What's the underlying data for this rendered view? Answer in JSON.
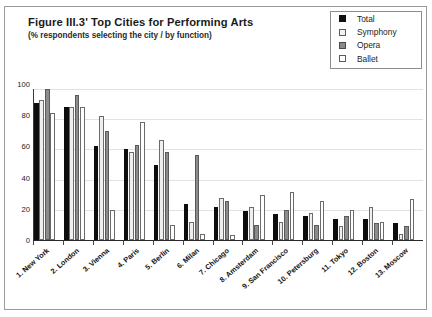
{
  "figure": {
    "title": "Figure III.3'  Top Cities for Performing Arts",
    "subtitle": "(% respondents selecting the city / by function)"
  },
  "legend": {
    "entries": [
      {
        "label": "Total",
        "swatch": "total-swatch",
        "color": "#0d0d0d"
      },
      {
        "label": "Symphony",
        "swatch": "symphony-swatch",
        "color": "#efefef"
      },
      {
        "label": "Opera",
        "swatch": "opera-swatch",
        "color": "#8c8c8c"
      },
      {
        "label": "Ballet",
        "swatch": "ballet-swatch",
        "color": "#ffffff"
      }
    ]
  },
  "axis": {
    "y_ticks": [
      "0",
      "20",
      "40",
      "60",
      "80",
      "100"
    ]
  },
  "chart_data": {
    "type": "bar",
    "title": "Figure III.3'  Top Cities for Performing Arts",
    "subtitle": "(% respondents selecting the city / by function)",
    "xlabel": "",
    "ylabel": "",
    "ylim": [
      0,
      100
    ],
    "ytick_step": 20,
    "grid": true,
    "legend_position": "top-right",
    "categories": [
      "1. New York",
      "2. London",
      "3. Vienna",
      "4. Paris",
      "5. Berlin",
      "6. Milan",
      "7. Chicago",
      "8. Amsterdam",
      "9. San Francisco",
      "10. Petersburg",
      "11. Tokyo",
      "12. Boston",
      "13. Moscow"
    ],
    "series": [
      {
        "name": "Total",
        "values": [
          91,
          88,
          62,
          60,
          50,
          24,
          22,
          19,
          17,
          16,
          14,
          14,
          11
        ]
      },
      {
        "name": "Symphony",
        "values": [
          93,
          88,
          82,
          58,
          66,
          12,
          28,
          22,
          12,
          18,
          9,
          22,
          4
        ]
      },
      {
        "name": "Opera",
        "values": [
          100,
          96,
          72,
          63,
          58,
          56,
          26,
          10,
          20,
          10,
          16,
          11,
          9
        ]
      },
      {
        "name": "Ballet",
        "values": [
          84,
          88,
          20,
          78,
          10,
          4,
          3,
          30,
          32,
          26,
          20,
          12,
          27
        ]
      }
    ]
  }
}
